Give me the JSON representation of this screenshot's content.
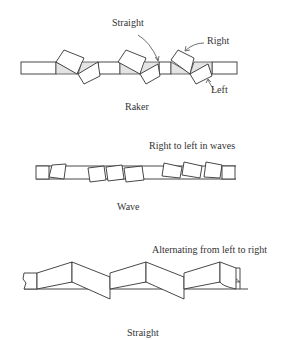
{
  "figure": {
    "panels": [
      {
        "id": "raker",
        "caption": "Raker",
        "annotations": {
          "straight": "Straight",
          "right": "Right",
          "left": "Left"
        }
      },
      {
        "id": "wave",
        "caption": "Wave",
        "annotations": {
          "description": "Right to left in waves"
        }
      },
      {
        "id": "straight",
        "caption": "Straight",
        "annotations": {
          "description": "Alternating from left to right"
        }
      }
    ]
  },
  "colors": {
    "line": "#333333",
    "shade": "#e4e4e4",
    "background": "#ffffff"
  }
}
